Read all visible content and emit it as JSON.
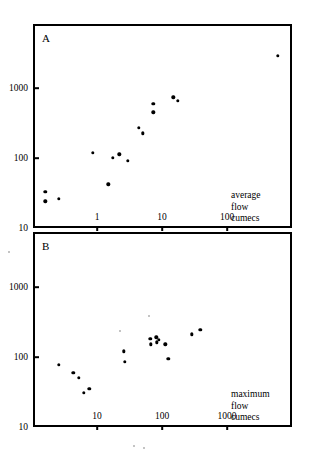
{
  "figure": {
    "background": "#ffffff",
    "ink": "#000000",
    "panels": [
      "A",
      "B"
    ]
  },
  "panelA": {
    "letter": "A",
    "caption_lines": [
      "average",
      "flow",
      "cumecs"
    ],
    "xticks": [
      "1",
      "10",
      "100"
    ],
    "yticks": [
      "1000",
      "100",
      "10"
    ]
  },
  "panelB": {
    "letter": "B",
    "caption_lines": [
      "maximum",
      "flow",
      "cumecs"
    ],
    "xticks": [
      "10",
      "100",
      "1000"
    ],
    "yticks": [
      "1000",
      "100",
      "10"
    ]
  },
  "chart_data": [
    {
      "type": "scatter",
      "title": "A",
      "panel": "A",
      "xlabel": "average flow cumecs",
      "ylabel": "",
      "xscale": "log",
      "yscale": "log",
      "xlim": [
        0.12,
        1000
      ],
      "ylim": [
        10,
        6500
      ],
      "xticks": [
        1,
        10,
        100
      ],
      "xticklabels": [
        "1",
        "10",
        "100"
      ],
      "yticks": [
        10,
        100,
        1000
      ],
      "yticklabels": [
        "10",
        "100",
        "1000"
      ],
      "grid": false,
      "legend": null,
      "marker": "filled-circle",
      "points": [
        {
          "x": 0.16,
          "y": 33
        },
        {
          "x": 0.16,
          "y": 24
        },
        {
          "x": 0.26,
          "y": 26
        },
        {
          "x": 1.5,
          "y": 42
        },
        {
          "x": 0.87,
          "y": 118
        },
        {
          "x": 1.75,
          "y": 100
        },
        {
          "x": 2.2,
          "y": 113
        },
        {
          "x": 3.0,
          "y": 91
        },
        {
          "x": 4.4,
          "y": 270
        },
        {
          "x": 5.1,
          "y": 225
        },
        {
          "x": 7.3,
          "y": 600
        },
        {
          "x": 7.3,
          "y": 450
        },
        {
          "x": 15.0,
          "y": 740
        },
        {
          "x": 17.5,
          "y": 660
        },
        {
          "x": 600,
          "y": 2900
        }
      ]
    },
    {
      "type": "scatter",
      "title": "B",
      "panel": "B",
      "xlabel": "maximum flow cumecs",
      "ylabel": "",
      "xscale": "log",
      "yscale": "log",
      "xlim": [
        1.2,
        10000
      ],
      "ylim": [
        10,
        6500
      ],
      "xticks": [
        10,
        100,
        1000
      ],
      "xticklabels": [
        "10",
        "100",
        "1000"
      ],
      "yticks": [
        10,
        100,
        1000
      ],
      "yticklabels": [
        "10",
        "100",
        "1000"
      ],
      "grid": false,
      "legend": null,
      "marker": "filled-circle",
      "points": [
        {
          "x": 2.6,
          "y": 77
        },
        {
          "x": 4.3,
          "y": 59
        },
        {
          "x": 5.3,
          "y": 50
        },
        {
          "x": 6.2,
          "y": 31
        },
        {
          "x": 7.6,
          "y": 35
        },
        {
          "x": 26,
          "y": 120
        },
        {
          "x": 27,
          "y": 86
        },
        {
          "x": 66,
          "y": 182
        },
        {
          "x": 67,
          "y": 152
        },
        {
          "x": 82,
          "y": 190
        },
        {
          "x": 83,
          "y": 163
        },
        {
          "x": 90,
          "y": 176
        },
        {
          "x": 112,
          "y": 152
        },
        {
          "x": 125,
          "y": 94
        },
        {
          "x": 290,
          "y": 212
        },
        {
          "x": 390,
          "y": 245
        }
      ]
    }
  ]
}
